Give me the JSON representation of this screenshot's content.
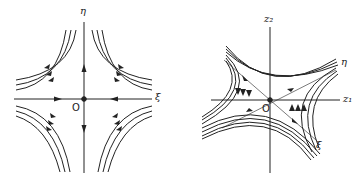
{
  "figures": [
    {
      "id": "left",
      "description": "Saddle point phase portrait in principal coordinates",
      "labels": {
        "vertical_axis": "η",
        "horizontal_axis": "ξ",
        "origin": "O"
      }
    },
    {
      "id": "right",
      "description": "Saddle point phase portrait in original coordinates (rotated)",
      "labels": {
        "vertical_axis": "z₂",
        "horizontal_axis": "z₁",
        "eta_axis": "η",
        "xi_axis": "ξ",
        "origin": "O"
      }
    }
  ],
  "colors": {
    "stroke": "#222222",
    "background": "#ffffff"
  }
}
